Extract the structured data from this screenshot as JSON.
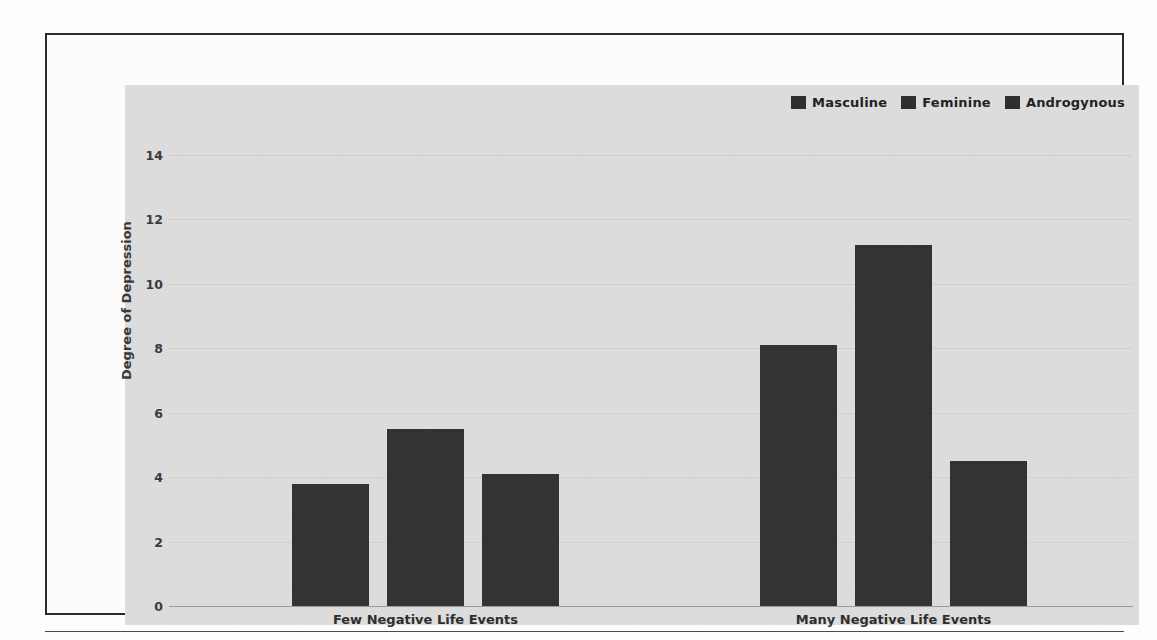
{
  "chart_data": {
    "type": "bar",
    "title": "",
    "xlabel": "",
    "ylabel": "Degree of Depression",
    "ylim": [
      0,
      15
    ],
    "yticks": [
      0,
      2,
      4,
      6,
      8,
      10,
      12,
      14
    ],
    "ytick_labels": [
      "0",
      "2",
      "4",
      "6",
      "8",
      "10",
      "12",
      "14"
    ],
    "grid": true,
    "legend_position": "top-right",
    "categories": [
      "Few Negative Life Events",
      "Many Negative Life Events"
    ],
    "series": [
      {
        "name": "Masculine",
        "values": [
          3.8,
          8.1
        ],
        "color": "#333333"
      },
      {
        "name": "Feminine",
        "values": [
          5.5,
          11.2
        ],
        "color": "#333333"
      },
      {
        "name": "Androgynous",
        "values": [
          4.1,
          4.5
        ],
        "color": "#333333"
      }
    ]
  },
  "legend": {
    "items": [
      {
        "label": "Masculine",
        "swatch_color": "#2f2f2f"
      },
      {
        "label": "Feminine",
        "swatch_color": "#2f2f2f"
      },
      {
        "label": "Androgynous",
        "swatch_color": "#2f2f2f"
      }
    ]
  },
  "axes": {
    "y_title": "Degree of Depression",
    "y_ticks": [
      "14",
      "12",
      "10",
      "8",
      "6",
      "4",
      "2",
      "0"
    ],
    "x_categories": [
      "Few Negative Life Events",
      "Many Negative Life Events"
    ]
  },
  "colors": {
    "panel_background": "#dcdcdc",
    "bar_fill": "#333333",
    "gridline": "#cfcfcf",
    "axis_line": "#9a9a9a",
    "frame_border": "#2b2b2b",
    "text": "#3a3a3a",
    "page_background": "#fdfdfd"
  }
}
